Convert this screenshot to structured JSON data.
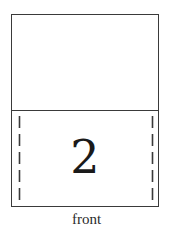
{
  "diagram": {
    "card": {
      "top_panel": {
        "content": ""
      },
      "bottom_panel": {
        "number": "2",
        "fold_lines": [
          "left-dashed",
          "right-dashed"
        ]
      }
    },
    "caption": "front"
  },
  "colors": {
    "line": "#3a3a3a",
    "text": "#1a1a1a",
    "background": "#ffffff"
  }
}
